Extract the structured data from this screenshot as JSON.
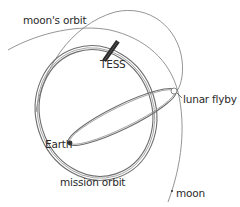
{
  "diagram": {
    "labels": {
      "moons_orbit": "moon's orbit",
      "tess": "TESS",
      "lunar_flyby": "lunar flyby",
      "earth": "Earth",
      "mission_orbit": "mission orbit",
      "moon": "moon"
    },
    "colors": {
      "line": "#7a7a7a",
      "orbit": "#6e6e6e",
      "satellite": "#2b2b2b",
      "text": "#2a2a2a",
      "background": "#ffffff"
    },
    "icons": {
      "satellite": "tess-satellite-icon",
      "earth": "earth-dot-icon",
      "flyby": "lunar-flyby-marker-icon",
      "moon": "moon-dot-icon"
    }
  }
}
